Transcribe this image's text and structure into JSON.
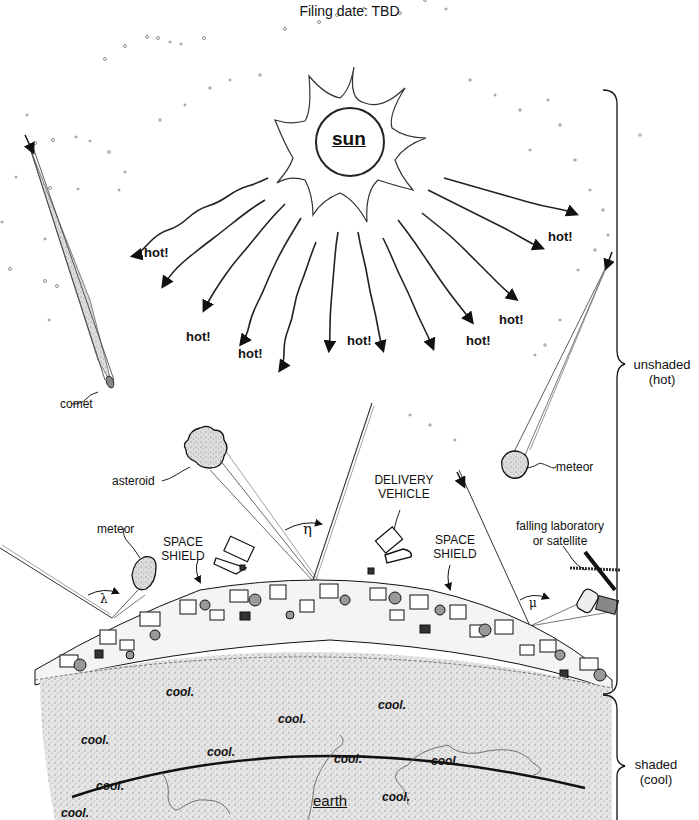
{
  "header": {
    "title": "Filing date: TBD"
  },
  "bodies": {
    "sun": "sun",
    "earth": "earth"
  },
  "heat_labels": [
    "hot!",
    "hot!",
    "hot!",
    "hot!",
    "hot!",
    "hot!",
    "hot!",
    "hot!"
  ],
  "cool_labels": [
    "cool.",
    "cool.",
    "cool.",
    "cool.",
    "cool.",
    "cool.",
    "cool.",
    "cool.",
    "cool.",
    "cool."
  ],
  "objects": {
    "comet": "comet",
    "asteroid": "asteroid",
    "meteor_left": "meteor",
    "meteor_right": "meteor",
    "delivery_vehicle_line1": "DELIVERY",
    "delivery_vehicle_line2": "VEHICLE",
    "space_shield_left_line1": "SPACE",
    "space_shield_left_line2": "SHIELD",
    "space_shield_right_line1": "SPACE",
    "space_shield_right_line2": "SHIELD",
    "falling_lab_line1": "falling laboratory",
    "falling_lab_line2": "or satellite"
  },
  "angles": {
    "eta": "η",
    "lambda": "λ",
    "mu": "μ"
  },
  "regions": {
    "unshaded_line1": "unshaded",
    "unshaded_line2": "(hot)",
    "shaded_line1": "shaded",
    "shaded_line2": "(cool)"
  },
  "colors": {
    "ink": "#111111",
    "stipple": "#cfcfcf",
    "background": "#ffffff"
  }
}
